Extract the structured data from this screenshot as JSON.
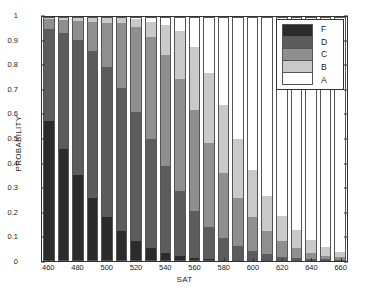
{
  "chart_data": {
    "type": "bar",
    "stacked": true,
    "title": "",
    "xlabel": "SAT",
    "ylabel": "PROBABILITY",
    "ylim": [
      0,
      1
    ],
    "yticks": [
      "0",
      "0.1",
      "0.2",
      "0.3",
      "0.4",
      "0.5",
      "0.6",
      "0.7",
      "0.8",
      "0.9",
      "1"
    ],
    "xticks": [
      "460",
      "480",
      "500",
      "520",
      "540",
      "560",
      "580",
      "600",
      "620",
      "640",
      "660"
    ],
    "grid": false,
    "legend_position": "top-right",
    "legend_entries": [
      "F",
      "D",
      "C",
      "B",
      "A"
    ],
    "categories": [
      460,
      470,
      480,
      490,
      500,
      510,
      520,
      530,
      540,
      550,
      560,
      570,
      580,
      590,
      600,
      610,
      620,
      630,
      640,
      650,
      660
    ],
    "series": [
      {
        "name": "F",
        "color": "#2b2b2b",
        "values": [
          0.575,
          0.46,
          0.352,
          0.259,
          0.18,
          0.122,
          0.081,
          0.052,
          0.034,
          0.021,
          0.013,
          0.008,
          0.005,
          0.003,
          0.002,
          0.001,
          0.001,
          0.0,
          0.0,
          0.0,
          0.0
        ]
      },
      {
        "name": "D",
        "color": "#5c5c5c",
        "values": [
          0.38,
          0.476,
          0.556,
          0.602,
          0.615,
          0.59,
          0.529,
          0.448,
          0.355,
          0.268,
          0.193,
          0.133,
          0.089,
          0.058,
          0.037,
          0.023,
          0.014,
          0.009,
          0.005,
          0.003,
          0.002
        ]
      },
      {
        "name": "C",
        "color": "#8f8f8f",
        "values": [
          0.04,
          0.051,
          0.078,
          0.118,
          0.182,
          0.267,
          0.351,
          0.418,
          0.457,
          0.455,
          0.411,
          0.341,
          0.266,
          0.196,
          0.139,
          0.095,
          0.063,
          0.04,
          0.025,
          0.015,
          0.009
        ]
      },
      {
        "name": "B",
        "color": "#c9c9c9",
        "values": [
          0.004,
          0.01,
          0.011,
          0.016,
          0.019,
          0.019,
          0.03,
          0.061,
          0.122,
          0.199,
          0.262,
          0.29,
          0.281,
          0.243,
          0.193,
          0.146,
          0.106,
          0.075,
          0.052,
          0.036,
          0.024
        ]
      },
      {
        "name": "A",
        "color": "#ffffff",
        "values": [
          0.001,
          0.003,
          0.003,
          0.005,
          0.004,
          0.002,
          0.009,
          0.021,
          0.032,
          0.057,
          0.121,
          0.228,
          0.359,
          0.5,
          0.629,
          0.735,
          0.816,
          0.876,
          0.918,
          0.946,
          0.965
        ]
      }
    ]
  },
  "axes": {
    "ylabel": "PROBABILITY",
    "xlabel": "SAT"
  }
}
